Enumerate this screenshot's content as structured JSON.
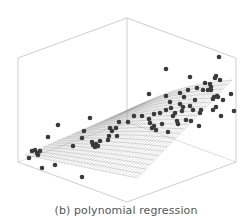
{
  "caption": "(b) polynomial regression",
  "colors": {
    "box": "#c8c8c8",
    "mesh": "#9a9a9a",
    "dot": "#3a3a3a",
    "caption": "#555555"
  },
  "chart_data": {
    "type": "scatter3d",
    "title": "(b) polynomial regression",
    "xlabel": "",
    "ylabel": "",
    "zlabel": "",
    "grid": false,
    "legend": null,
    "box": {
      "top": [
        [
          18,
          58
        ],
        [
          127,
          18
        ],
        [
          236,
          58
        ],
        [
          127,
          98
        ]
      ],
      "bottom": [
        [
          18,
          162
        ],
        [
          127,
          202
        ],
        [
          236,
          162
        ],
        [
          127,
          122
        ]
      ]
    },
    "surface": {
      "corners": [
        [
          25,
          155
        ],
        [
          137,
          178
        ],
        [
          232,
          80
        ],
        [
          128,
          110
        ]
      ],
      "rows": 22,
      "cols": 40
    },
    "points_pixel": [
      [
        29,
        158
      ],
      [
        32,
        151
      ],
      [
        35,
        150
      ],
      [
        37,
        153
      ],
      [
        38,
        155
      ],
      [
        40,
        151
      ],
      [
        42,
        168
      ],
      [
        55,
        165
      ],
      [
        48,
        137
      ],
      [
        58,
        125
      ],
      [
        73,
        146
      ],
      [
        82,
        177
      ],
      [
        82,
        138
      ],
      [
        84,
        131
      ],
      [
        90,
        118
      ],
      [
        92,
        142
      ],
      [
        93,
        145
      ],
      [
        95,
        147
      ],
      [
        96,
        144
      ],
      [
        98,
        146
      ],
      [
        100,
        141
      ],
      [
        108,
        140
      ],
      [
        109,
        136
      ],
      [
        110,
        128
      ],
      [
        112,
        131
      ],
      [
        116,
        128
      ],
      [
        117,
        136
      ],
      [
        119,
        122
      ],
      [
        128,
        122
      ],
      [
        134,
        116
      ],
      [
        142,
        116
      ],
      [
        149,
        119
      ],
      [
        150,
        123
      ],
      [
        152,
        128
      ],
      [
        154,
        126
      ],
      [
        154,
        114
      ],
      [
        156,
        130
      ],
      [
        160,
        113
      ],
      [
        162,
        124
      ],
      [
        166,
        96
      ],
      [
        166,
        110
      ],
      [
        168,
        132
      ],
      [
        170,
        102
      ],
      [
        171,
        108
      ],
      [
        173,
        116
      ],
      [
        175,
        113
      ],
      [
        177,
        121
      ],
      [
        178,
        124
      ],
      [
        180,
        104
      ],
      [
        180,
        93
      ],
      [
        182,
        111
      ],
      [
        183,
        107
      ],
      [
        184,
        97
      ],
      [
        186,
        120
      ],
      [
        188,
        90
      ],
      [
        190,
        106
      ],
      [
        191,
        121
      ],
      [
        193,
        110
      ],
      [
        195,
        100
      ],
      [
        197,
        88
      ],
      [
        199,
        126
      ],
      [
        200,
        113
      ],
      [
        201,
        110
      ],
      [
        203,
        90
      ],
      [
        205,
        83
      ],
      [
        208,
        90
      ],
      [
        210,
        84
      ],
      [
        211,
        90
      ],
      [
        213,
        110
      ],
      [
        214,
        97
      ],
      [
        215,
        78
      ],
      [
        216,
        107
      ],
      [
        217,
        96
      ],
      [
        218,
        97
      ],
      [
        220,
        80
      ],
      [
        221,
        116
      ],
      [
        223,
        100
      ],
      [
        149,
        94
      ],
      [
        166,
        69
      ],
      [
        190,
        77
      ],
      [
        219,
        57
      ],
      [
        211,
        87
      ],
      [
        231,
        94
      ],
      [
        234,
        111
      ],
      [
        213,
        99
      ],
      [
        216,
        76
      ]
    ]
  }
}
